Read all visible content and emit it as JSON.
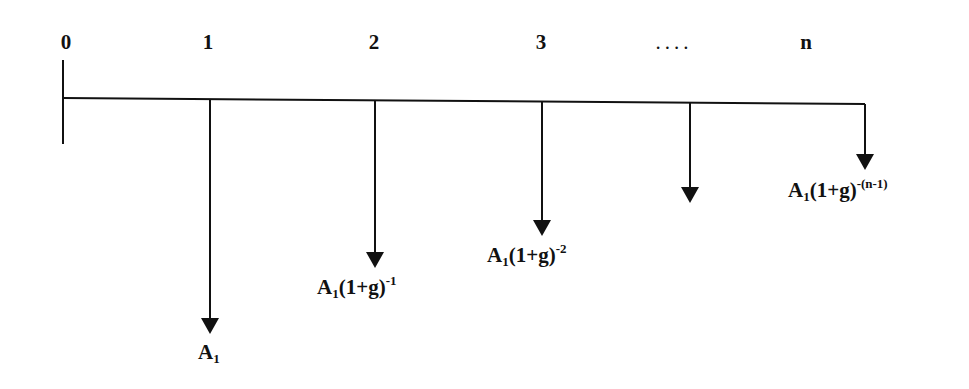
{
  "timeline": {
    "periods": [
      {
        "label": "0",
        "x": 63
      },
      {
        "label": "1",
        "x": 210
      },
      {
        "label": "2",
        "x": 375
      },
      {
        "label": "3",
        "x": 542
      },
      {
        "label": "....",
        "x": 690
      },
      {
        "label": "n",
        "x": 865
      }
    ],
    "axis_y": 99,
    "axis_start_x": 63,
    "axis_end_x": 865
  },
  "cash_flows": [
    {
      "period": "1",
      "x": 210,
      "tip_y": 334,
      "base": "A",
      "sub": "1",
      "paren": "(1+g)",
      "exp": "",
      "label_x": 198,
      "label_y": 340
    },
    {
      "period": "2",
      "x": 375,
      "tip_y": 268,
      "base": "A",
      "sub": "1",
      "paren": "(1+g)",
      "exp": "-1",
      "label_x": 317,
      "label_y": 274
    },
    {
      "period": "3",
      "x": 542,
      "tip_y": 236,
      "base": "A",
      "sub": "1",
      "paren": "(1+g)",
      "exp": "-2",
      "label_x": 487,
      "label_y": 242
    },
    {
      "period": "....",
      "x": 690,
      "tip_y": 203,
      "base": "",
      "sub": "",
      "paren": "",
      "exp": "",
      "label_x": 0,
      "label_y": 0
    },
    {
      "period": "n",
      "x": 865,
      "tip_y": 170,
      "base": "A",
      "sub": "1",
      "paren": "(1+g)",
      "exp": "-(n-1)",
      "label_x": 788,
      "label_y": 177
    }
  ],
  "labels": {
    "a1": {
      "base": "A",
      "sub": "1"
    },
    "a2": {
      "base": "A",
      "sub": "1",
      "paren": "(1+g)",
      "exp": "-1"
    },
    "a3": {
      "base": "A",
      "sub": "1",
      "paren": "(1+g)",
      "exp": "-2"
    },
    "an": {
      "base": "A",
      "sub": "1",
      "paren": "(1+g)",
      "exp": "-(n-1)"
    }
  },
  "colors": {
    "line": "#111111",
    "background": "#ffffff"
  }
}
